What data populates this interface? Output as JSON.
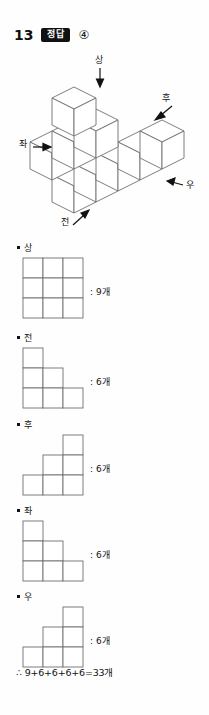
{
  "header": {
    "question_number": "13",
    "answer_badge_label": "정답",
    "answer_choice": "④"
  },
  "figure": {
    "caption_top": "상",
    "caption_back": "후",
    "caption_left": "좌",
    "caption_right": "우",
    "caption_front": "전"
  },
  "views": [
    {
      "label": "상",
      "count_text": ": 9개",
      "count_value": 9,
      "shape": "3x3 full square",
      "cells": [
        [
          1,
          1,
          1
        ],
        [
          1,
          1,
          1
        ],
        [
          1,
          1,
          1
        ]
      ]
    },
    {
      "label": "전",
      "count_text": ": 6개",
      "count_value": 6,
      "shape": "left-aligned staircase",
      "cells": [
        [
          1,
          0,
          0
        ],
        [
          1,
          1,
          0
        ],
        [
          1,
          1,
          1
        ]
      ]
    },
    {
      "label": "후",
      "count_text": ": 6개",
      "count_value": 6,
      "shape": "right-aligned staircase",
      "cells": [
        [
          0,
          0,
          1
        ],
        [
          0,
          1,
          1
        ],
        [
          1,
          1,
          1
        ]
      ]
    },
    {
      "label": "좌",
      "count_text": ": 6개",
      "count_value": 6,
      "shape": "left-aligned staircase",
      "cells": [
        [
          1,
          0,
          0
        ],
        [
          1,
          1,
          0
        ],
        [
          1,
          1,
          1
        ]
      ]
    },
    {
      "label": "우",
      "count_text": ": 6개",
      "count_value": 6,
      "shape": "right-aligned staircase",
      "cells": [
        [
          0,
          0,
          1
        ],
        [
          0,
          1,
          1
        ],
        [
          1,
          1,
          1
        ]
      ]
    }
  ],
  "conclusion": {
    "text": "∴ 9+6+6+6+6=33개"
  },
  "colors": {
    "ink": "#111111",
    "line": "#6f6f6f",
    "paper": "#fefefe",
    "badge_bg": "#111111",
    "badge_fg": "#ffffff"
  }
}
